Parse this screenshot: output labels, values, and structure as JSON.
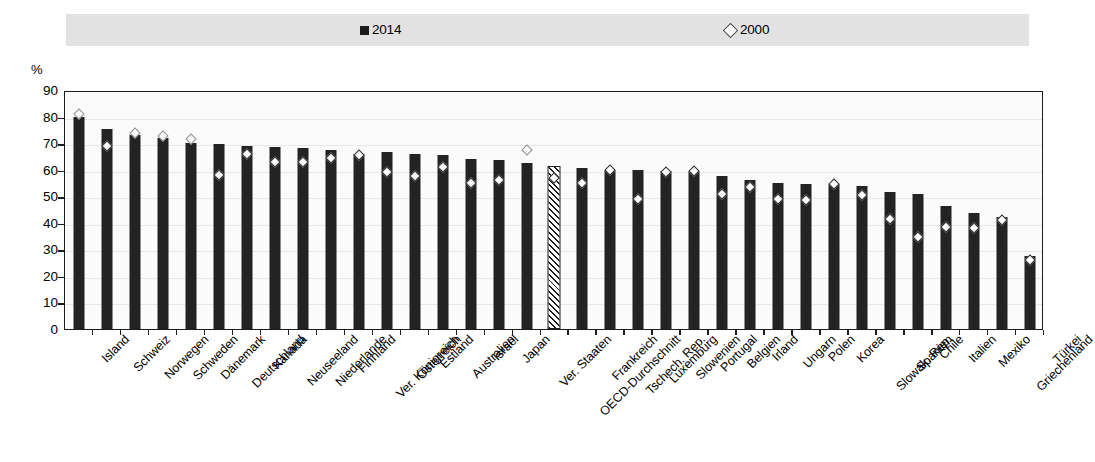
{
  "legend": {
    "entries": [
      {
        "label": "2014",
        "marker": "filled-square-icon",
        "color": "#232323"
      },
      {
        "label": "2000",
        "marker": "open-diamond-icon",
        "color": "#ffffff"
      }
    ]
  },
  "axis": {
    "unit_label": "%",
    "y_ticks": [
      "90",
      "80",
      "70",
      "60",
      "50",
      "40",
      "30",
      "20",
      "10",
      "0"
    ]
  },
  "chart_data": {
    "type": "bar",
    "title": "",
    "subtitle": "",
    "xlabel": "",
    "ylabel": "%",
    "ylim": [
      0,
      90
    ],
    "ytick_step": 10,
    "grid": true,
    "legend_position": "top",
    "highlight_category": "OECD-Durchschnitt",
    "highlight_style": "hatched",
    "categories": [
      "Island",
      "Schweiz",
      "Norwegen",
      "Schweden",
      "Dänemark",
      "Deutschland",
      "Kanada",
      "Neuseeland",
      "Niederlande",
      "Finnland",
      "Ver. Königreich",
      "Österreich",
      "Estland",
      "Australien",
      "Israel",
      "Japan",
      "Ver. Staaten",
      "OECD-Durchschnitt",
      "Frankreich",
      "Tschech. Rep.",
      "Luxemburg",
      "Slowenien",
      "Portugal",
      "Belgien",
      "Irland",
      "Ungarn",
      "Polen",
      "Korea",
      "Slowak. Rep.",
      "Spanien",
      "Chile",
      "Italien",
      "Mexiko",
      "Griechenland",
      "Türkei"
    ],
    "series": [
      {
        "name": "2014",
        "marker": "bar",
        "values": [
          80.0,
          75.5,
          73.0,
          72.0,
          70.0,
          69.5,
          69.0,
          68.5,
          68.0,
          67.5,
          66.0,
          66.5,
          66.0,
          65.5,
          64.0,
          63.5,
          62.5,
          60.5,
          60.5,
          60.0,
          60.0,
          59.5,
          59.5,
          57.5,
          56.0,
          55.0,
          54.5,
          54.5,
          54.0,
          51.5,
          51.0,
          46.5,
          43.5,
          42.0,
          27.5
        ]
      },
      {
        "name": "2000",
        "marker": "open-diamond",
        "values": [
          81.0,
          69.0,
          74.0,
          72.5,
          71.5,
          58.0,
          66.0,
          63.0,
          63.0,
          64.5,
          65.5,
          59.0,
          57.5,
          61.0,
          55.0,
          56.0,
          67.5,
          57.0,
          55.0,
          60.0,
          49.0,
          59.0,
          59.5,
          51.0,
          53.5,
          49.0,
          48.5,
          54.5,
          50.5,
          41.5,
          34.5,
          38.5,
          38.0,
          41.0,
          26.0
        ]
      }
    ]
  }
}
